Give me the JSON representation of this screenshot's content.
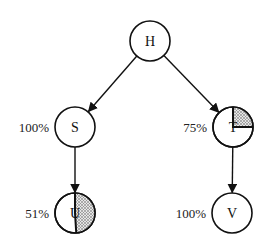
{
  "diagram": {
    "type": "tree",
    "nodes": [
      {
        "id": "H",
        "label": "H",
        "x": 150,
        "y": 41,
        "r": 20,
        "percent": null,
        "shaded_fraction": 0
      },
      {
        "id": "S",
        "label": "S",
        "x": 75,
        "y": 127,
        "r": 20,
        "percent": "100%",
        "shaded_fraction": 0
      },
      {
        "id": "T",
        "label": "T",
        "x": 233,
        "y": 127,
        "r": 20,
        "percent": "75%",
        "shaded_fraction": 0.25
      },
      {
        "id": "U",
        "label": "U",
        "x": 75,
        "y": 213,
        "r": 20,
        "percent": "51%",
        "shaded_fraction": 0.49
      },
      {
        "id": "V",
        "label": "V",
        "x": 232,
        "y": 213,
        "r": 20,
        "percent": "100%",
        "shaded_fraction": 0
      }
    ],
    "edges": [
      {
        "from": "H",
        "to": "S"
      },
      {
        "from": "H",
        "to": "T"
      },
      {
        "from": "S",
        "to": "U"
      },
      {
        "from": "T",
        "to": "V"
      }
    ],
    "colors": {
      "stroke": "#111111",
      "background": "#ffffff",
      "shading": "#888888"
    }
  }
}
